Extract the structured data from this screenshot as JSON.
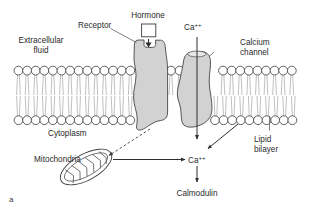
{
  "figure": {
    "letter": "a",
    "caption_letter_position": "bottom-left"
  },
  "labels": {
    "extracellular_fluid_line1": "Extracellular",
    "extracellular_fluid_line2": "fluid",
    "receptor": "Receptor",
    "hormone": "Hormone",
    "calcium_ion_top": "Ca",
    "calcium_ion_top_sup": "++",
    "calcium_channel_line1": "Calcium",
    "calcium_channel_line2": "channel",
    "cytoplasm": "Cytoplasm",
    "lipid_bilayer_line1": "Lipid",
    "lipid_bilayer_line2": "bilayer",
    "mitochondria": "Mitochondria",
    "calcium_ion_cytoplasm": "Ca",
    "calcium_ion_cytoplasm_sup": "++",
    "calmodulin": "Calmodulin"
  },
  "icons": {
    "hormone_ligand": "hormone-square-icon",
    "receptor_protein": "receptor-protein-icon",
    "channel_protein": "calcium-channel-protein-icon",
    "mitochondrion": "mitochondrion-icon",
    "phospholipid": "phospholipid-molecule-icon"
  },
  "arrows": [
    {
      "name": "hormone-binding-arrow",
      "from": "hormone",
      "to": "receptor-binding-site",
      "style": "solid-filled-triangle",
      "direction": "down"
    },
    {
      "name": "calcium-influx-arrow",
      "from": "extracellular-calcium",
      "to": "cytoplasmic-calcium",
      "style": "solid",
      "direction": "down",
      "passes_through": "calcium-channel-pore"
    },
    {
      "name": "receptor-to-mitochondria-arrow",
      "from": "receptor-protein",
      "to": "mitochondrion",
      "style": "dashed",
      "direction": "down-left"
    },
    {
      "name": "mitochondria-to-calcium-arrow",
      "from": "mitochondrion",
      "to": "cytoplasmic-calcium",
      "style": "solid",
      "direction": "right"
    },
    {
      "name": "channel-to-calcium-arrow",
      "from": "calcium-channel",
      "to": "cytoplasmic-calcium",
      "style": "solid",
      "direction": "down-left"
    },
    {
      "name": "calcium-to-calmodulin-arrow",
      "from": "cytoplasmic-calcium",
      "to": "calmodulin",
      "style": "solid",
      "direction": "down"
    }
  ],
  "membrane": {
    "head_count_top_left": 14,
    "head_count_top_gap": 2,
    "head_count_top_right": 9,
    "head_count_bottom_left": 14,
    "head_count_bottom_right": 10,
    "layer_label": "phospholipid bilayer"
  },
  "colors": {
    "background": "#ffffff",
    "protein_fill": "#d2d2d2",
    "protein_stroke": "#454545",
    "text": "#2b2b2b",
    "membrane_head_stroke": "#3b3b3b",
    "membrane_tail": "#8d8d8d",
    "arrow": "#2e2e2e"
  }
}
